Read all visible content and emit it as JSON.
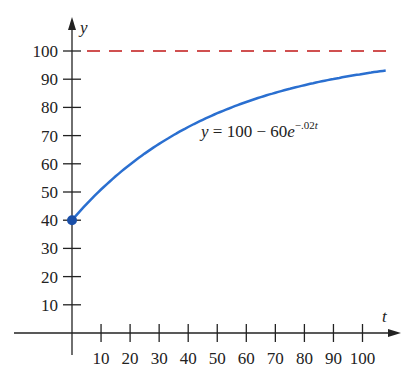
{
  "chart_data": {
    "type": "line",
    "title": "",
    "xlabel": "t",
    "ylabel": "y",
    "xlim": [
      0,
      108
    ],
    "ylim": [
      0,
      100
    ],
    "x_ticks": [
      10,
      20,
      30,
      40,
      50,
      60,
      70,
      80,
      90,
      100
    ],
    "y_ticks": [
      10,
      20,
      30,
      40,
      50,
      60,
      70,
      80,
      90,
      100
    ],
    "grid": false,
    "series": [
      {
        "name": "y = 100 - 60e^(-.02t)",
        "formula": "100 - 60*exp(-0.02*t)",
        "color": "#2a6fd0",
        "x": [
          0,
          10,
          20,
          30,
          40,
          50,
          60,
          70,
          80,
          90,
          100,
          108
        ],
        "values": [
          40,
          50.9,
          59.8,
          67.1,
          73.0,
          77.9,
          81.9,
          85.2,
          88.0,
          90.1,
          91.9,
          93.0
        ]
      },
      {
        "name": "asymptote y = 100",
        "color": "#d05050",
        "style": "dashed",
        "x": [
          0,
          108
        ],
        "values": [
          100,
          100
        ]
      }
    ],
    "annotations": [
      {
        "text": "y = 100 − 60e^(−.02t)",
        "x": 62,
        "y": 74
      },
      {
        "type": "point",
        "x": 0,
        "y": 40,
        "color": "#1a4fa8"
      }
    ]
  },
  "labels": {
    "x_axis": "t",
    "y_axis": "y",
    "eq_y": "y",
    "eq_mid": " = 100 − 60",
    "eq_e": "e",
    "eq_exp": "−.02",
    "eq_exp_t": "t"
  },
  "x_tick_labels": [
    "10",
    "20",
    "30",
    "40",
    "50",
    "60",
    "70",
    "80",
    "90",
    "100"
  ],
  "y_tick_labels": [
    "10",
    "20",
    "30",
    "40",
    "50",
    "60",
    "70",
    "80",
    "90",
    "100"
  ]
}
